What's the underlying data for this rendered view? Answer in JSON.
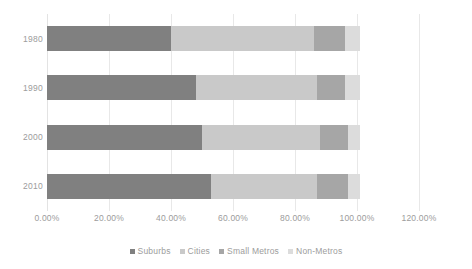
{
  "chart_data": {
    "type": "bar",
    "orientation": "horizontal",
    "stacked": true,
    "title": "",
    "xlabel": "",
    "ylabel": "",
    "categories": [
      "1980",
      "1990",
      "2000",
      "2010"
    ],
    "xticks": [
      "0.00%",
      "20.00%",
      "40.00%",
      "60.00%",
      "80.00%",
      "100.00%",
      "120.00%"
    ],
    "xtick_values": [
      0,
      20,
      40,
      60,
      80,
      100,
      120
    ],
    "xlim": [
      0,
      120
    ],
    "grid": true,
    "legend_position": "bottom",
    "series": [
      {
        "name": "Suburbs",
        "color": "#808080",
        "values": [
          40.0,
          48.0,
          50.0,
          53.0
        ]
      },
      {
        "name": "Cities",
        "color": "#c9c9c9",
        "values": [
          46.0,
          39.0,
          38.0,
          34.0
        ]
      },
      {
        "name": "Small Metros",
        "color": "#a6a6a6",
        "values": [
          10.0,
          9.0,
          9.0,
          10.0
        ]
      },
      {
        "name": "Non-Metros",
        "color": "#dcdcdc",
        "values": [
          5.0,
          5.0,
          4.0,
          4.0
        ]
      }
    ]
  },
  "colors": {
    "background": "#ffffff",
    "gridline": "#e8e8e8",
    "tick_text": "#9c9c9c"
  }
}
